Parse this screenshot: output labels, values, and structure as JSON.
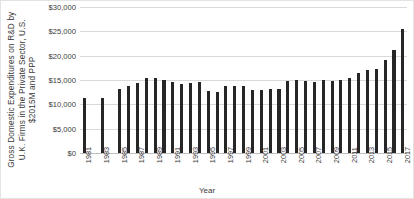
{
  "chart_data": {
    "type": "bar",
    "title": "",
    "xlabel": "Year",
    "ylabel": "Gross Domestic Expenditures on R&D by U.K. Firms in the Private Sector, U.S. $2015M and PPP",
    "ylabel_lines": [
      "Gross Domestic Expenditures on R&D by",
      "U.K. Firms in the Private Sector, U.S.",
      "$2015M and PPP"
    ],
    "ylim": [
      0,
      30000
    ],
    "ytick_values": [
      0,
      5000,
      10000,
      15000,
      20000,
      25000,
      30000
    ],
    "ytick_labels": [
      "$0",
      "$5,000",
      "$10,000",
      "$15,000",
      "$20,000",
      "$25,000",
      "$30,000"
    ],
    "grid": true,
    "legend": "none",
    "bar_color": "#262626",
    "grid_color": "#d9d9d9",
    "categories": [
      "1981",
      "1982",
      "1983",
      "1984",
      "1985",
      "1986",
      "1987",
      "1988",
      "1989",
      "1990",
      "1991",
      "1992",
      "1993",
      "1994",
      "1995",
      "1996",
      "1997",
      "1998",
      "1999",
      "2000",
      "2001",
      "2002",
      "2003",
      "2004",
      "2005",
      "2006",
      "2007",
      "2008",
      "2009",
      "2010",
      "2011",
      "2012",
      "2013",
      "2014",
      "2015",
      "2016",
      "2017"
    ],
    "xtick_labels_shown": [
      "1981",
      "1983",
      "1985",
      "1987",
      "1989",
      "1991",
      "1993",
      "1995",
      "1997",
      "1999",
      "2001",
      "2003",
      "2005",
      "2007",
      "2009",
      "2011",
      "2013",
      "2015",
      "2017"
    ],
    "values": [
      11400,
      null,
      11400,
      null,
      13100,
      13800,
      14400,
      15400,
      15400,
      15100,
      14600,
      14200,
      14400,
      14600,
      12800,
      12600,
      13800,
      13800,
      13700,
      13000,
      12900,
      13100,
      13100,
      14700,
      15100,
      14800,
      14600,
      15100,
      14700,
      15000,
      15400,
      16400,
      17100,
      17300,
      19100,
      21100,
      25500
    ]
  }
}
